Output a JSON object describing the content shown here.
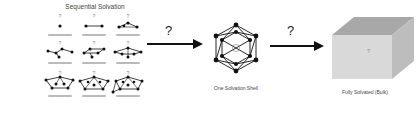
{
  "diagram": {
    "sequential": {
      "title": "Sequential Solvation",
      "clusters": [
        {
          "row": 0,
          "col": 0,
          "n": 1
        },
        {
          "row": 0,
          "col": 1,
          "n": 2
        },
        {
          "row": 0,
          "col": 2,
          "n": 3
        },
        {
          "row": 1,
          "col": 0,
          "n": 4
        },
        {
          "row": 1,
          "col": 1,
          "n": 5
        },
        {
          "row": 1,
          "col": 2,
          "n": 6
        },
        {
          "row": 2,
          "col": 0,
          "n": 7
        },
        {
          "row": 2,
          "col": 1,
          "n": 8
        },
        {
          "row": 2,
          "col": 2,
          "n": 9
        }
      ]
    },
    "arrow1": {
      "label": "?"
    },
    "shell": {
      "caption": "One Solvation Shell"
    },
    "arrow2": {
      "label": "?"
    },
    "bulk": {
      "caption": "Fully Solvated (Bulk)"
    },
    "colors": {
      "line": "#111111",
      "cube_front": "#d9d9d9",
      "cube_top": "#a8a8a8",
      "cube_side": "#bdbdbd"
    }
  }
}
